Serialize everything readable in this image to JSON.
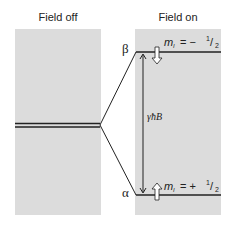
{
  "panels": {
    "left": {
      "title": "Field off"
    },
    "right": {
      "title": "Field on"
    }
  },
  "levels": {
    "upper": {
      "state": "β",
      "ml_label": "m",
      "ml_sub": "I",
      "ml_value": "= −",
      "ml_num": "1",
      "ml_den": "2",
      "spin": "down"
    },
    "lower": {
      "state": "α",
      "ml_label": "m",
      "ml_sub": "I",
      "ml_value": "= +",
      "ml_num": "1",
      "ml_den": "2",
      "spin": "up"
    }
  },
  "gap_label": "γħB",
  "colors": {
    "panel": "#dcdcdc",
    "line": "#222222"
  }
}
